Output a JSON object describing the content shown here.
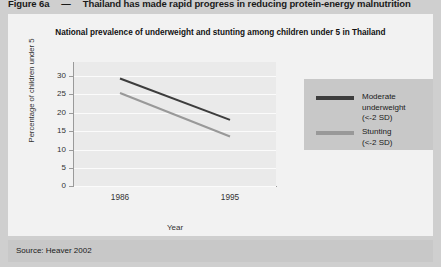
{
  "figure": {
    "number_label": "Figure 6a",
    "dash": "—",
    "headline": "Thailand has made rapid progress in reducing protein-energy malnutrition",
    "source": "Source: Heaver 2002"
  },
  "colors": {
    "header_band": "#cfcfcf",
    "panel": "#f2f2f2",
    "plot": "#eaeaea",
    "gridline": "#fbfbfb",
    "axis": "#9a9a9a",
    "legend_box": "#c8c8c8",
    "source_band": "#c8c8c8",
    "series_underweight": "#3d3d3d",
    "series_stunting": "#999999"
  },
  "chart_data": {
    "type": "line",
    "title": "National prevalence of underweight and stunting among children under 5 in Thailand",
    "xlabel": "Year",
    "ylabel": "Percentage of children under 5",
    "categories": [
      "1986",
      "1995"
    ],
    "x": [
      1986,
      1995
    ],
    "xtick_labels": [
      "1986",
      "1995"
    ],
    "ytick_labels": [
      "0",
      "5",
      "10",
      "15",
      "20",
      "25",
      "30"
    ],
    "yticks": [
      0,
      5,
      10,
      15,
      20,
      25,
      30
    ],
    "ylim": [
      0,
      30
    ],
    "grid": true,
    "legend_position": "right",
    "series": [
      {
        "name": "Moderate underweight (<-2 SD)",
        "legend_line1": "Moderate",
        "legend_line2": "underweight",
        "legend_line3": "(<-2 SD)",
        "color": "#3d3d3d",
        "values": [
          26,
          16
        ]
      },
      {
        "name": "Stunting (<-2 SD)",
        "legend_line1": "Stunting",
        "legend_line2": "(<-2 SD)",
        "legend_line3": "",
        "color": "#999999",
        "values": [
          22.5,
          12
        ]
      }
    ]
  }
}
